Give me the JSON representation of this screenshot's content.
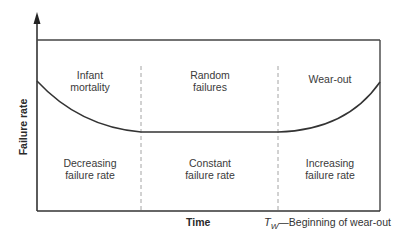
{
  "diagram": {
    "type": "bathtub-curve",
    "y_axis_label": "Failure rate",
    "x_axis_label": "Time",
    "legend": {
      "symbol": "T",
      "subscript": "W",
      "dash": "—",
      "text": "Beginning of wear-out"
    },
    "regions": [
      {
        "phase_line1": "Infant",
        "phase_line2": "mortality",
        "trend_line1": "Decreasing",
        "trend_line2": "failure rate"
      },
      {
        "phase_line1": "Random",
        "phase_line2": "failures",
        "trend_line1": "Constant",
        "trend_line2": "failure rate"
      },
      {
        "phase_line1": "Wear-out",
        "phase_line2": "",
        "trend_line1": "Increasing",
        "trend_line2": "failure rate"
      }
    ],
    "colors": {
      "line": "#333333",
      "dashed_divider": "#9a9a9a",
      "text": "#3a3a3a",
      "background": "#ffffff"
    }
  }
}
